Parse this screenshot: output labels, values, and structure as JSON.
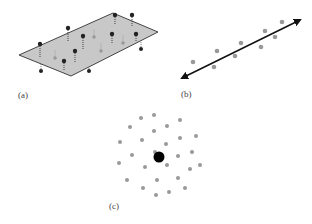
{
  "panels": {
    "a": {
      "label": "(a)",
      "plane": {
        "points": "19,55 113,13 158,32 71,76",
        "fill": "#c8c8c8",
        "stroke": "#444444"
      },
      "points_above": [
        {
          "x": 40,
          "y": 44,
          "base": 58,
          "color": "#222222"
        },
        {
          "x": 68,
          "y": 28,
          "base": 42,
          "color": "#222222"
        },
        {
          "x": 83,
          "y": 36,
          "base": 50,
          "color": "#222222"
        },
        {
          "x": 75,
          "y": 51,
          "base": 62,
          "color": "#222222"
        },
        {
          "x": 64,
          "y": 61,
          "base": 70,
          "color": "#222222"
        },
        {
          "x": 115,
          "y": 15,
          "base": 24,
          "color": "#222222"
        },
        {
          "x": 112,
          "y": 34,
          "base": 44,
          "color": "#222222"
        },
        {
          "x": 136,
          "y": 34,
          "base": 42,
          "color": "#222222"
        },
        {
          "x": 132,
          "y": 15,
          "base": 26,
          "color": "#222222"
        }
      ],
      "points_on_plane": [
        {
          "x": 55,
          "y": 58,
          "color": "#999999"
        },
        {
          "x": 94,
          "y": 37,
          "color": "#999999"
        },
        {
          "x": 101,
          "y": 51,
          "color": "#999999"
        },
        {
          "x": 123,
          "y": 43,
          "color": "#999999"
        }
      ],
      "points_below": [
        {
          "x": 41,
          "y": 71,
          "top": 58,
          "color": "#222222"
        },
        {
          "x": 89,
          "y": 71,
          "top": 62,
          "color": "#222222"
        },
        {
          "x": 141,
          "y": 49,
          "top": 40,
          "color": "#222222"
        }
      ]
    },
    "b": {
      "label": "(b)",
      "arrow": {
        "x1": 182,
        "y1": 78,
        "x2": 300,
        "y2": 20,
        "color": "#111111"
      },
      "points": [
        {
          "x": 193,
          "y": 62
        },
        {
          "x": 214,
          "y": 67
        },
        {
          "x": 217,
          "y": 51
        },
        {
          "x": 235,
          "y": 56
        },
        {
          "x": 241,
          "y": 43
        },
        {
          "x": 261,
          "y": 47
        },
        {
          "x": 265,
          "y": 31
        },
        {
          "x": 275,
          "y": 37
        },
        {
          "x": 282,
          "y": 22
        }
      ],
      "point_color": "#999999"
    },
    "c": {
      "label": "(c)",
      "center": {
        "x": 159,
        "y": 157,
        "r": 5.5,
        "color": "#000000"
      },
      "points": [
        {
          "x": 141,
          "y": 118
        },
        {
          "x": 154,
          "y": 115
        },
        {
          "x": 180,
          "y": 120
        },
        {
          "x": 130,
          "y": 127
        },
        {
          "x": 154,
          "y": 131
        },
        {
          "x": 167,
          "y": 126
        },
        {
          "x": 120,
          "y": 142
        },
        {
          "x": 142,
          "y": 140
        },
        {
          "x": 166,
          "y": 144
        },
        {
          "x": 180,
          "y": 138
        },
        {
          "x": 196,
          "y": 136
        },
        {
          "x": 132,
          "y": 155
        },
        {
          "x": 155,
          "y": 152
        },
        {
          "x": 178,
          "y": 156
        },
        {
          "x": 192,
          "y": 152
        },
        {
          "x": 119,
          "y": 163
        },
        {
          "x": 145,
          "y": 167
        },
        {
          "x": 167,
          "y": 165
        },
        {
          "x": 190,
          "y": 169
        },
        {
          "x": 200,
          "y": 165
        },
        {
          "x": 127,
          "y": 180
        },
        {
          "x": 157,
          "y": 180
        },
        {
          "x": 178,
          "y": 178
        },
        {
          "x": 143,
          "y": 188
        },
        {
          "x": 169,
          "y": 192
        },
        {
          "x": 185,
          "y": 188
        },
        {
          "x": 156,
          "y": 195
        }
      ],
      "point_color": "#999999"
    }
  }
}
